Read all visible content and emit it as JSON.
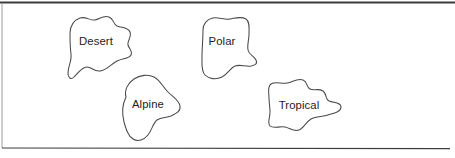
{
  "figure": {
    "background_color": "#ffffff",
    "width": 455,
    "height": 158,
    "rules": {
      "top_line_color": "#3c3c3c",
      "bottom_line_color": "#3c3c3c",
      "left_line_color": "#8e8e8e"
    },
    "outline_color": "#4a4a4a",
    "label_color": "#1d1d1d"
  },
  "regions": [
    {
      "id": "desert",
      "label": "Desert",
      "label_x": 96,
      "label_y": 42,
      "path": "M 70 33 C 70 26, 74 20, 80 18 C 86 16, 90 21, 95 20 C 100 19, 103 15, 109 17 C 114 19, 113 24, 117 26 C 122 28, 128 27, 130 32 C 132 37, 127 41, 128 45 C 129 49, 133 51, 131 55 C 129 59, 122 58, 117 61 C 111 64, 107 70, 100 71 C 94 72, 92 67, 87 67 C 82 67, 78 73, 74 77 C 71 80, 68 78, 68 73 C 68 66, 72 61, 71 54 C 70 47, 70 40, 70 33 Z"
    },
    {
      "id": "polar",
      "label": "Polar",
      "label_x": 222,
      "label_y": 42,
      "path": "M 203 30 C 203 24, 207 19, 213 18 C 219 17, 224 20, 230 19 C 236 18, 241 16, 246 19 C 250 22, 249 28, 249 34 C 249 40, 247 45, 248 50 C 249 55, 254 56, 256 60 C 258 64, 255 65, 251 66 C 246 67, 240 64, 235 66 C 230 68, 228 74, 222 77 C 216 80, 209 79, 205 75 C 201 71, 202 64, 202 57 C 202 48, 203 39, 203 30 Z"
    },
    {
      "id": "alpine",
      "label": "Alpine",
      "label_x": 148,
      "label_y": 105,
      "path": "M 126 97 C 124 90, 128 83, 134 79 C 140 75, 148 74, 154 77 C 160 80, 163 87, 168 92 C 173 97, 179 100, 180 106 C 181 112, 175 114, 171 116 C 166 118, 161 117, 157 120 C 153 123, 152 130, 148 135 C 144 140, 138 142, 133 139 C 128 136, 126 129, 124 122 C 122 114, 122 105, 126 97 Z"
    },
    {
      "id": "tropical",
      "label": "Tropical",
      "label_x": 299,
      "label_y": 106,
      "path": "M 269 98 C 269 92, 267 87, 271 84 C 275 81, 281 84, 287 83 C 293 82, 297 78, 303 80 C 308 82, 306 87, 310 89 C 314 91, 319 88, 323 91 C 327 94, 325 99, 329 101 C 334 103, 341 102, 341 107 C 341 112, 334 113, 328 115 C 322 117, 316 116, 311 119 C 306 122, 304 128, 299 130 C 294 132, 290 128, 285 127 C 279 126, 273 129, 270 126 C 267 123, 270 118, 270 112 C 270 107, 269 102, 269 98 Z"
    }
  ]
}
